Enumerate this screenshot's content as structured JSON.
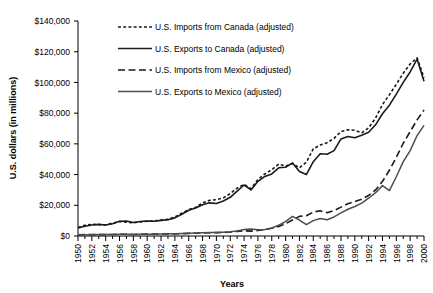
{
  "chart_data": {
    "type": "line",
    "title": "",
    "xlabel": "Years",
    "ylabel": "U.S. dollars (in millions)",
    "xlim": [
      1950,
      2000
    ],
    "ylim": [
      0,
      140000
    ],
    "ytick_labels": [
      "$140,000",
      "$120,000",
      "$100,000",
      "$80,000",
      "$60,000",
      "$40,000",
      "$20,000",
      "$0"
    ],
    "ytick_values": [
      140000,
      120000,
      100000,
      80000,
      60000,
      40000,
      20000,
      0
    ],
    "xtick_labels": [
      "1950",
      "1952",
      "1954",
      "1956",
      "1958",
      "1960",
      "1962",
      "1964",
      "1966",
      "1968",
      "1970",
      "1972",
      "1974",
      "1976",
      "1978",
      "1980",
      "1982",
      "1984",
      "1986",
      "1988",
      "1990",
      "1992",
      "1994",
      "1996",
      "1998",
      "2000"
    ],
    "minor_tick_interval": 1,
    "grid": false,
    "legend_position": "top-center",
    "x": [
      1950,
      1951,
      1952,
      1953,
      1954,
      1955,
      1956,
      1957,
      1958,
      1959,
      1960,
      1961,
      1962,
      1963,
      1964,
      1965,
      1966,
      1967,
      1968,
      1969,
      1970,
      1971,
      1972,
      1973,
      1974,
      1975,
      1976,
      1977,
      1978,
      1979,
      1980,
      1981,
      1982,
      1983,
      1984,
      1985,
      1986,
      1987,
      1988,
      1989,
      1990,
      1991,
      1992,
      1993,
      1994,
      1995,
      1996,
      1997,
      1998,
      1999,
      2000
    ],
    "series": [
      {
        "name": "U.S. Imports from Canada (adjusted)",
        "style": "short-dash",
        "color": "#1a1a1a",
        "values": [
          5600,
          7000,
          7600,
          7400,
          7200,
          8400,
          9400,
          9000,
          8600,
          9200,
          9600,
          9800,
          10400,
          10800,
          12400,
          14800,
          17200,
          18600,
          21600,
          23200,
          23600,
          24800,
          27600,
          31200,
          33600,
          30800,
          36800,
          40400,
          43200,
          46800,
          45600,
          47200,
          44400,
          48000,
          56800,
          59200,
          60800,
          63600,
          68000,
          69200,
          68800,
          67200,
          70400,
          76800,
          85600,
          92000,
          98800,
          106000,
          112000,
          116000,
          103000
        ]
      },
      {
        "name": "U.S. Exports to Canada (adjusted)",
        "style": "solid",
        "color": "#1a1a1a",
        "values": [
          5200,
          6400,
          7200,
          7600,
          7200,
          8000,
          9600,
          9800,
          8800,
          9400,
          9800,
          9600,
          10200,
          10600,
          11800,
          14200,
          16800,
          18200,
          20400,
          21600,
          21200,
          22800,
          25200,
          29200,
          33200,
          30000,
          35600,
          38800,
          40400,
          44400,
          44800,
          47600,
          42000,
          40000,
          48400,
          53600,
          53200,
          55600,
          63200,
          64800,
          64000,
          65600,
          67600,
          72400,
          79600,
          85200,
          92400,
          100000,
          106800,
          115200,
          100800
        ]
      },
      {
        "name": "U.S. Imports from Mexico (adjusted)",
        "style": "long-dash",
        "color": "#1a1a1a",
        "values": [
          800,
          900,
          900,
          900,
          900,
          1000,
          1100,
          1100,
          1000,
          1100,
          1200,
          1200,
          1300,
          1300,
          1400,
          1500,
          1700,
          1800,
          2000,
          2100,
          2200,
          2300,
          2600,
          3000,
          3400,
          3200,
          3600,
          4200,
          5000,
          6200,
          8000,
          10400,
          12800,
          13200,
          15600,
          16400,
          15200,
          16600,
          18800,
          21000,
          22400,
          24000,
          26400,
          30000,
          35600,
          42800,
          51200,
          60400,
          68000,
          75600,
          82000
        ]
      },
      {
        "name": "U.S. Exports to Mexico (adjusted)",
        "style": "solid-gray",
        "color": "#4d4d4d",
        "values": [
          700,
          800,
          800,
          900,
          900,
          1000,
          1100,
          1100,
          1000,
          1100,
          1200,
          1200,
          1300,
          1400,
          1500,
          1600,
          1800,
          1900,
          2100,
          2200,
          2300,
          2500,
          2700,
          3200,
          4200,
          4600,
          4000,
          4200,
          5200,
          7000,
          9400,
          12800,
          10400,
          7400,
          10000,
          11400,
          10600,
          12400,
          15000,
          17400,
          19200,
          21400,
          24600,
          28200,
          32800,
          29600,
          38600,
          48400,
          55600,
          65400,
          72000
        ]
      }
    ]
  },
  "legend": {
    "items": [
      {
        "label": "U.S. Imports from Canada (adjusted)",
        "style": "short-dash"
      },
      {
        "label": "U.S. Exports to Canada (adjusted)",
        "style": "solid"
      },
      {
        "label": "U.S. Imports from Mexico (adjusted)",
        "style": "long-dash"
      },
      {
        "label": "U.S. Exports to Mexico (adjusted)",
        "style": "solid-gray"
      }
    ]
  }
}
